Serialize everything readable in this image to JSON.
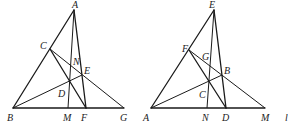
{
  "figures": [
    {
      "id": "figure-1",
      "points": {
        "A": [
          74,
          10
        ],
        "B": [
          13,
          108
        ],
        "C": [
          50,
          49
        ],
        "D": [
          70,
          81
        ],
        "E": [
          82,
          75
        ],
        "F": [
          86,
          108
        ],
        "G": [
          124,
          108
        ],
        "M": [
          68,
          108
        ],
        "N": [
          75,
          64
        ]
      },
      "labels": {
        "A": {
          "text": "A",
          "x": 72,
          "y": 8
        },
        "B": {
          "text": "B",
          "x": 7,
          "y": 121
        },
        "C": {
          "text": "C",
          "x": 40,
          "y": 49
        },
        "N": {
          "text": "N",
          "x": 73,
          "y": 65
        },
        "E": {
          "text": "E",
          "x": 84,
          "y": 74
        },
        "D": {
          "text": "D",
          "x": 58,
          "y": 97
        },
        "M": {
          "text": "M",
          "x": 63,
          "y": 121
        },
        "F": {
          "text": "F",
          "x": 81,
          "y": 121
        },
        "G": {
          "text": "G",
          "x": 120,
          "y": 121
        }
      }
    },
    {
      "id": "figure-2",
      "points": {
        "E": [
          214,
          10
        ],
        "A": [
          151,
          108
        ],
        "F": [
          189,
          50
        ],
        "G": [
          203,
          58
        ],
        "B": [
          222,
          75
        ],
        "C": [
          209,
          80
        ],
        "N": [
          207,
          108
        ],
        "D": [
          226,
          108
        ],
        "M": [
          265,
          108
        ]
      },
      "labels": {
        "E": {
          "text": "E",
          "x": 209,
          "y": 8
        },
        "A": {
          "text": "A",
          "x": 143,
          "y": 121
        },
        "F": {
          "text": "F",
          "x": 182,
          "y": 52
        },
        "G": {
          "text": "G",
          "x": 202,
          "y": 60
        },
        "B": {
          "text": "B",
          "x": 224,
          "y": 74
        },
        "C": {
          "text": "C",
          "x": 199,
          "y": 98
        },
        "N": {
          "text": "N",
          "x": 202,
          "y": 121
        },
        "D": {
          "text": "D",
          "x": 222,
          "y": 121
        },
        "M": {
          "text": "M",
          "x": 261,
          "y": 121
        }
      }
    }
  ],
  "edge_fragment": {
    "text": "l",
    "x": 285,
    "y": 121
  }
}
